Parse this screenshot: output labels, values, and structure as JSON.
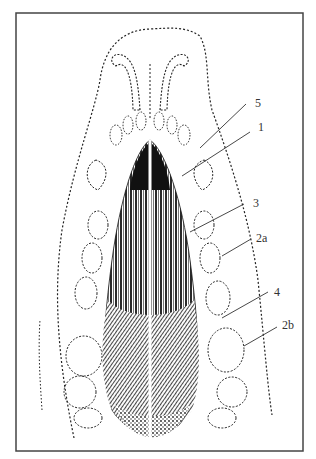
{
  "figure": {
    "type": "anatomical-illustration",
    "frame": {
      "x": 16,
      "y": 13,
      "width": 287,
      "height": 438,
      "stroke": "#444444"
    },
    "labels": [
      {
        "id": "5",
        "text": "5",
        "x": 255,
        "y": 107,
        "line": [
          246,
          104,
          200,
          148
        ]
      },
      {
        "id": "1",
        "text": "1",
        "x": 258,
        "y": 131,
        "line": [
          250,
          132,
          182,
          176
        ]
      },
      {
        "id": "3",
        "text": "3",
        "x": 253,
        "y": 207,
        "line": [
          244,
          204,
          190,
          232
        ]
      },
      {
        "id": "2a",
        "text": "2a",
        "x": 256,
        "y": 242,
        "line": [
          251,
          239,
          222,
          256
        ]
      },
      {
        "id": "4",
        "text": "4",
        "x": 274,
        "y": 296,
        "line": [
          268,
          292,
          222,
          318
        ]
      },
      {
        "id": "2b",
        "text": "2b",
        "x": 282,
        "y": 329,
        "line": [
          277,
          327,
          244,
          346
        ]
      }
    ],
    "colors": {
      "ink": "#111111",
      "label": "#333333",
      "background": "#ffffff"
    }
  }
}
